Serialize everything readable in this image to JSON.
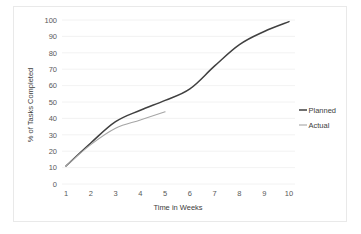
{
  "chart_data": {
    "type": "line",
    "title": "",
    "xlabel": "Time in Weeks",
    "ylabel": "% of Tasks Completed",
    "x": [
      1,
      2,
      3,
      4,
      5,
      6,
      7,
      8,
      9,
      10
    ],
    "xtick_labels": [
      "1",
      "2",
      "3",
      "4",
      "5",
      "6",
      "7",
      "8",
      "9",
      "10"
    ],
    "ytick_labels": [
      "0",
      "10",
      "20",
      "30",
      "40",
      "50",
      "60",
      "70",
      "80",
      "90",
      "100"
    ],
    "yticks": [
      0,
      10,
      20,
      30,
      40,
      50,
      60,
      70,
      80,
      90,
      100
    ],
    "xlim": [
      1,
      10
    ],
    "ylim": [
      0,
      100
    ],
    "grid": "horizontal",
    "legend_position": "right",
    "series": [
      {
        "name": "Planned",
        "color": "#404040",
        "x": [
          1,
          2,
          3,
          4,
          5,
          6,
          7,
          8,
          9,
          10
        ],
        "values": [
          11,
          25,
          38,
          45,
          51,
          58,
          72,
          85,
          93,
          99
        ]
      },
      {
        "name": "Actual",
        "color": "#a6a6a6",
        "x": [
          1,
          2,
          3,
          4,
          5
        ],
        "values": [
          11,
          24,
          34,
          39,
          44
        ]
      }
    ]
  },
  "legend": {
    "items": [
      {
        "label": "Planned"
      },
      {
        "label": "Actual"
      }
    ]
  }
}
